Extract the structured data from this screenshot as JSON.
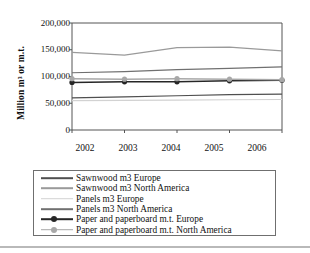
{
  "chart_data": {
    "type": "line",
    "title": "",
    "xlabel": "",
    "ylabel": "Million m³ or m.t.",
    "x": [
      2002,
      2003,
      2004,
      2005,
      2006
    ],
    "categories": [
      "2002",
      "2003",
      "2004",
      "2005",
      "2006"
    ],
    "ytick_labels": [
      "200,000",
      "150,000",
      "100,000",
      "50,000",
      "0"
    ],
    "ytick_values": [
      200000,
      150000,
      100000,
      50000,
      0
    ],
    "ylim": [
      0,
      200000
    ],
    "xlim": [
      2002,
      2006
    ],
    "grid": false,
    "legend_position": "bottom",
    "series": [
      {
        "name": "Sawnwood m3 Europe",
        "color": "#4f4f4f",
        "marker": "none",
        "values": [
          60000,
          62000,
          64000,
          66000,
          67000
        ]
      },
      {
        "name": "Sawnwood m3 North America",
        "color": "#9a9a9a",
        "marker": "none",
        "values": [
          145000,
          140000,
          154000,
          155000,
          148000
        ]
      },
      {
        "name": "Panels m3 Europe",
        "color": "#d2d2d2",
        "marker": "none",
        "values": [
          55000,
          55500,
          56000,
          56500,
          57000
        ]
      },
      {
        "name": "Panels m3 North America",
        "color": "#707070",
        "marker": "none",
        "values": [
          107000,
          109000,
          113000,
          115000,
          118000
        ]
      },
      {
        "name": "Paper and paperboard m.t. Europe",
        "color": "#262626",
        "marker": "circle",
        "values": [
          89000,
          90000,
          90000,
          92000,
          93000
        ]
      },
      {
        "name": "Paper and paperboard m.t. North America",
        "color": "#a8a8a8",
        "marker": "circle",
        "values": [
          96000,
          95000,
          96000,
          95000,
          94000
        ]
      }
    ]
  },
  "axis": {
    "frame_color": "#555555",
    "background": "#ffffff"
  }
}
